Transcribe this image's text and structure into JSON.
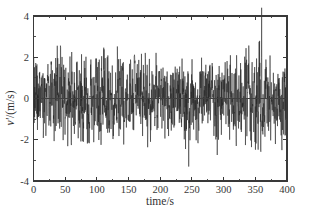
{
  "figure": {
    "background_color": "#ffffff",
    "trace_color": "#0d0d0d",
    "axis_color": "#232323",
    "width": 310,
    "height": 218
  },
  "chart_data": {
    "type": "line",
    "title": "",
    "subtitle": "",
    "xlabel": "time/s",
    "ylabel": "v'/(m/s)",
    "ylabel_parts": {
      "symbol": "v",
      "prime": "'",
      "unit": "/(m/s)"
    },
    "xlim": [
      0,
      400
    ],
    "ylim": [
      -4,
      4
    ],
    "xticks": [
      0,
      50,
      100,
      150,
      200,
      250,
      300,
      350,
      400
    ],
    "xtick_labels": [
      "0",
      "50",
      "100",
      "150",
      "200",
      "250",
      "300",
      "350",
      "400"
    ],
    "yticks": [
      -4,
      -2,
      0,
      2,
      4
    ],
    "ytick_labels": [
      "-4",
      "-2",
      "0",
      "2",
      "4"
    ],
    "x_minor_interval": 25,
    "y_minor_interval": 1,
    "grid": false,
    "legend": null,
    "tick_direction": "in",
    "frame": "box",
    "zero_reference_line": 0,
    "series": [
      {
        "name": "v'",
        "description": "turbulent velocity fluctuation time series",
        "mean": 0.0,
        "std_dev": 1.05,
        "sample_interval_s": 0.25,
        "n_points": 1600,
        "min": -3.3,
        "max": 4.4,
        "min_at_t": 245,
        "max_at_t": 360,
        "envelope_t": [
          0,
          20,
          40,
          60,
          80,
          100,
          120,
          140,
          160,
          180,
          200,
          215,
          230,
          245,
          260,
          280,
          300,
          320,
          340,
          360,
          380,
          400
        ],
        "envelope_upper": [
          2.0,
          2.3,
          2.6,
          2.5,
          2.2,
          2.1,
          2.9,
          2.3,
          2.2,
          2.5,
          2.9,
          3.0,
          3.0,
          2.3,
          2.2,
          2.7,
          2.7,
          2.3,
          2.6,
          4.4,
          3.6,
          2.6
        ],
        "envelope_lower": [
          -2.1,
          -2.4,
          -2.8,
          -2.3,
          -2.2,
          -2.5,
          -2.4,
          -2.2,
          -3.0,
          -2.5,
          -2.5,
          -2.6,
          -3.1,
          -3.3,
          -2.2,
          -2.6,
          -3.1,
          -2.3,
          -2.4,
          -2.6,
          -2.7,
          -2.5
        ]
      }
    ]
  }
}
